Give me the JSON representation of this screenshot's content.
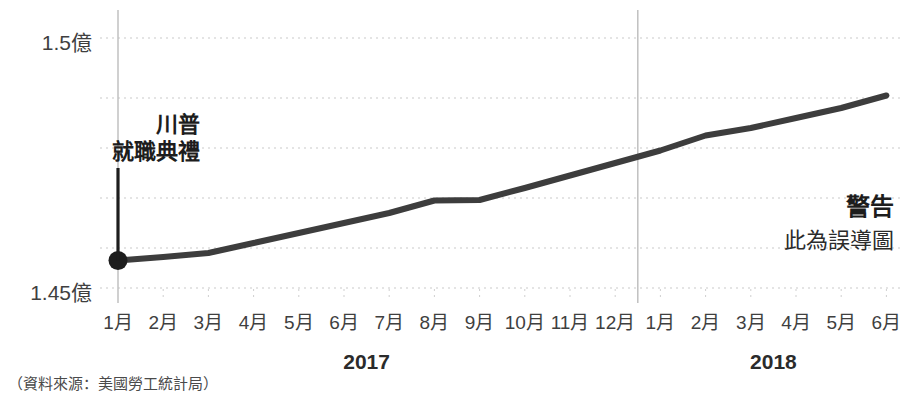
{
  "chart_data": {
    "type": "line",
    "title": "",
    "subtitle": "",
    "xlabel": "",
    "ylabel": "",
    "grid": true,
    "legend_position": "none",
    "ylim": [
      145000000,
      150000000
    ],
    "y_tick_labels": [
      "1.45億",
      "1.5億"
    ],
    "y_tick_values": [
      145000000,
      150000000
    ],
    "gridline_values": [
      145000000,
      145800000,
      146800000,
      147800000,
      148800000,
      150000000
    ],
    "categories": [
      "1月",
      "2月",
      "3月",
      "4月",
      "5月",
      "6月",
      "7月",
      "8月",
      "9月",
      "10月",
      "11月",
      "12月",
      "1月",
      "2月",
      "3月",
      "4月",
      "5月",
      "6月"
    ],
    "x_group_labels": [
      "2017",
      "2018"
    ],
    "x_group_spans": [
      12,
      6
    ],
    "series": [
      {
        "name": "就業人數",
        "values": [
          145550000,
          145620000,
          145700000,
          145900000,
          146100000,
          146300000,
          146500000,
          146750000,
          146760000,
          147000000,
          147250000,
          147500000,
          147750000,
          148050000,
          148200000,
          148400000,
          148600000,
          148850000
        ]
      }
    ],
    "annotations": [
      {
        "name": "trump-inauguration",
        "text_lines": [
          "川普",
          "就職典禮"
        ],
        "at_category": "1月",
        "at_group": "2017",
        "marker": "dot"
      },
      {
        "name": "misleading-warning",
        "text_lines": [
          "警告",
          "此為誤導圖"
        ]
      }
    ],
    "source": "（資料來源：美國勞工統計局）"
  },
  "axis": {
    "y_top_label": "1.5億",
    "y_bottom_label": "1.45億"
  },
  "annotation": {
    "line1": "川普",
    "line2": "就職典禮"
  },
  "warning": {
    "title": "警告",
    "subtitle": "此為誤導圖"
  },
  "years": {
    "first": "2017",
    "second": "2018"
  },
  "source": {
    "text": "（資料來源：美國勞工統計局）"
  },
  "colors": {
    "line": "#3d3d3d",
    "grid": "#c9c9c9",
    "vertical_rule": "#bcbcbc",
    "text": "#3a3a3a",
    "background": "#ffffff"
  }
}
